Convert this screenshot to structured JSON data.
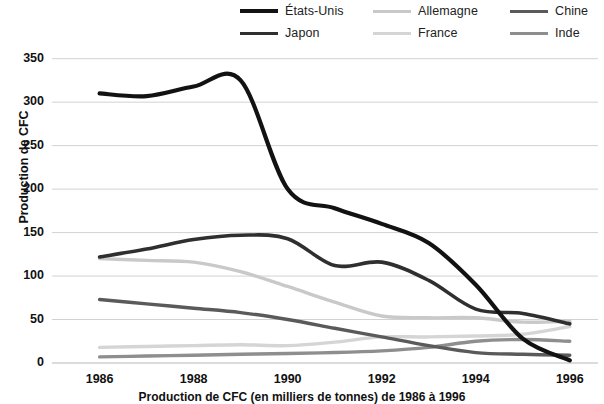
{
  "chart_data": {
    "type": "line",
    "title": "",
    "caption": "Production de CFC (en milliers de tonnes) de 1986 à 1996",
    "xlabel": "",
    "ylabel": "Production de CFC",
    "x": [
      1986,
      1987,
      1988,
      1989,
      1990,
      1991,
      1992,
      1993,
      1994,
      1995,
      1996
    ],
    "xlim": [
      1985.2,
      1996.6
    ],
    "ylim": [
      0,
      360
    ],
    "xticks": [
      1986,
      1988,
      1990,
      1992,
      1994,
      1996
    ],
    "xtick_labels": [
      "1986",
      "1988",
      "1990",
      "1992",
      "1994",
      "1996"
    ],
    "yticks": [
      0,
      50,
      100,
      150,
      200,
      250,
      300,
      350
    ],
    "ytick_labels": [
      "0",
      "50",
      "100",
      "150",
      "200",
      "250",
      "300",
      "350"
    ],
    "grid": "horizontal",
    "legend_position": "top",
    "series": [
      {
        "name": "États-Unis",
        "color": "#121212",
        "width": 4.2,
        "values": [
          310,
          307,
          318,
          325,
          200,
          178,
          160,
          138,
          90,
          28,
          3
        ]
      },
      {
        "name": "Allemagne",
        "color": "#c9c9c9",
        "width": 3.4,
        "values": [
          120,
          118,
          116,
          105,
          88,
          70,
          54,
          52,
          52,
          47,
          48
        ]
      },
      {
        "name": "Chine",
        "color": "#5a5a5a",
        "width": 3.4,
        "values": [
          73,
          68,
          63,
          58,
          50,
          40,
          30,
          20,
          12,
          10,
          9
        ]
      },
      {
        "name": "Japon",
        "color": "#2f2f2f",
        "width": 3.6,
        "values": [
          122,
          131,
          142,
          147,
          143,
          112,
          116,
          95,
          62,
          57,
          45
        ]
      },
      {
        "name": "France",
        "color": "#d5d5d5",
        "width": 3.4,
        "values": [
          18,
          19,
          20,
          21,
          20,
          24,
          30,
          30,
          31,
          33,
          42
        ]
      },
      {
        "name": "Inde",
        "color": "#8e8e8e",
        "width": 3.4,
        "values": [
          7,
          8,
          9,
          10,
          11,
          12,
          14,
          18,
          25,
          27,
          25
        ]
      }
    ]
  },
  "legend": {
    "rows": [
      [
        "États-Unis",
        "Allemagne",
        "Chine"
      ],
      [
        "Japon",
        "France",
        "Inde"
      ]
    ]
  },
  "axis": {
    "y_axis_title": "Production de CFC"
  }
}
